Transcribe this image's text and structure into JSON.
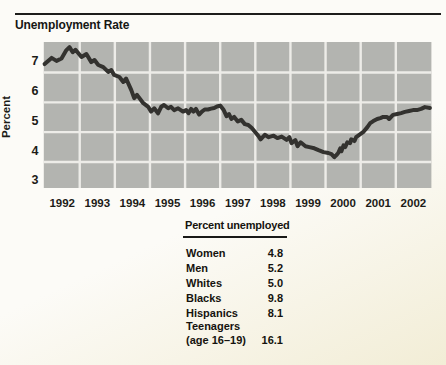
{
  "chart": {
    "title": "Unemployment Rate",
    "y_axis_label": "Percent"
  },
  "chart_data": {
    "type": "line",
    "title": "Unemployment Rate",
    "xlabel": "",
    "ylabel": "Percent",
    "x_ticks": [
      1992,
      1993,
      1994,
      1995,
      1996,
      1997,
      1998,
      1999,
      2000,
      2001,
      2002
    ],
    "y_ticks": [
      7,
      6,
      5,
      4,
      3
    ],
    "y_gridlines": [
      6.5,
      5.5,
      4.5,
      3.5
    ],
    "xlim": [
      1992,
      2003
    ],
    "ylim": [
      2.9,
      7.5
    ],
    "grid": true,
    "legend": false,
    "colors": {
      "plot_bg": "#b3b4b0",
      "gridline": "#edece8",
      "line": "#33322f",
      "text": "#1c1b17"
    },
    "series": [
      {
        "name": "Unemployment rate (percent)",
        "points": [
          [
            1992.0,
            6.78
          ],
          [
            1992.2,
            6.99
          ],
          [
            1992.34,
            6.89
          ],
          [
            1992.48,
            6.97
          ],
          [
            1992.62,
            7.25
          ],
          [
            1992.71,
            7.35
          ],
          [
            1992.8,
            7.18
          ],
          [
            1992.88,
            7.26
          ],
          [
            1993.05,
            7.02
          ],
          [
            1993.19,
            7.12
          ],
          [
            1993.33,
            6.85
          ],
          [
            1993.42,
            6.92
          ],
          [
            1993.53,
            6.75
          ],
          [
            1993.67,
            6.68
          ],
          [
            1993.81,
            6.52
          ],
          [
            1993.9,
            6.58
          ],
          [
            1993.98,
            6.42
          ],
          [
            1994.13,
            6.35
          ],
          [
            1994.24,
            6.18
          ],
          [
            1994.32,
            6.3
          ],
          [
            1994.47,
            5.91
          ],
          [
            1994.55,
            5.64
          ],
          [
            1994.63,
            5.75
          ],
          [
            1994.81,
            5.47
          ],
          [
            1994.95,
            5.35
          ],
          [
            1995.03,
            5.19
          ],
          [
            1995.12,
            5.3
          ],
          [
            1995.23,
            5.13
          ],
          [
            1995.32,
            5.35
          ],
          [
            1995.4,
            5.41
          ],
          [
            1995.52,
            5.3
          ],
          [
            1995.6,
            5.35
          ],
          [
            1995.69,
            5.24
          ],
          [
            1995.8,
            5.3
          ],
          [
            1995.94,
            5.19
          ],
          [
            1996.03,
            5.24
          ],
          [
            1996.1,
            5.14
          ],
          [
            1996.17,
            5.28
          ],
          [
            1996.24,
            5.19
          ],
          [
            1996.31,
            5.28
          ],
          [
            1996.4,
            5.09
          ],
          [
            1996.48,
            5.19
          ],
          [
            1996.56,
            5.26
          ],
          [
            1996.65,
            5.26
          ],
          [
            1996.74,
            5.29
          ],
          [
            1996.83,
            5.31
          ],
          [
            1996.91,
            5.36
          ],
          [
            1997.0,
            5.39
          ],
          [
            1997.1,
            5.24
          ],
          [
            1997.18,
            5.04
          ],
          [
            1997.25,
            5.11
          ],
          [
            1997.32,
            4.94
          ],
          [
            1997.4,
            5.01
          ],
          [
            1997.5,
            4.86
          ],
          [
            1997.6,
            4.91
          ],
          [
            1997.7,
            4.77
          ],
          [
            1997.8,
            4.74
          ],
          [
            1997.9,
            4.64
          ],
          [
            1998.0,
            4.5
          ],
          [
            1998.1,
            4.35
          ],
          [
            1998.15,
            4.26
          ],
          [
            1998.27,
            4.41
          ],
          [
            1998.38,
            4.33
          ],
          [
            1998.52,
            4.38
          ],
          [
            1998.63,
            4.3
          ],
          [
            1998.75,
            4.35
          ],
          [
            1998.89,
            4.24
          ],
          [
            1998.97,
            4.33
          ],
          [
            1999.03,
            4.13
          ],
          [
            1999.14,
            4.23
          ],
          [
            1999.2,
            4.03
          ],
          [
            1999.29,
            4.16
          ],
          [
            1999.43,
            4.03
          ],
          [
            1999.54,
            4.0
          ],
          [
            1999.68,
            3.96
          ],
          [
            1999.8,
            3.9
          ],
          [
            1999.94,
            3.83
          ],
          [
            2000.08,
            3.8
          ],
          [
            2000.17,
            3.76
          ],
          [
            2000.25,
            3.66
          ],
          [
            2000.31,
            3.73
          ],
          [
            2000.36,
            3.8
          ],
          [
            2000.42,
            3.96
          ],
          [
            2000.45,
            3.86
          ],
          [
            2000.51,
            4.06
          ],
          [
            2000.56,
            4.0
          ],
          [
            2000.62,
            4.16
          ],
          [
            2000.7,
            4.13
          ],
          [
            2000.73,
            4.26
          ],
          [
            2000.82,
            4.2
          ],
          [
            2000.87,
            4.33
          ],
          [
            2000.99,
            4.43
          ],
          [
            2001.07,
            4.5
          ],
          [
            2001.19,
            4.67
          ],
          [
            2001.27,
            4.8
          ],
          [
            2001.36,
            4.87
          ],
          [
            2001.47,
            4.94
          ],
          [
            2001.56,
            4.97
          ],
          [
            2001.64,
            5.01
          ],
          [
            2001.75,
            5.01
          ],
          [
            2001.81,
            4.94
          ],
          [
            2001.92,
            5.08
          ],
          [
            2002.04,
            5.11
          ],
          [
            2002.15,
            5.14
          ],
          [
            2002.26,
            5.18
          ],
          [
            2002.38,
            5.21
          ],
          [
            2002.49,
            5.24
          ],
          [
            2002.6,
            5.24
          ],
          [
            2002.72,
            5.28
          ],
          [
            2002.83,
            5.34
          ],
          [
            2002.97,
            5.31
          ]
        ]
      }
    ]
  },
  "table": {
    "header": "Percent unemployed",
    "rows": [
      {
        "label": "Women",
        "value": "4.8"
      },
      {
        "label": "Men",
        "value": "5.2"
      },
      {
        "label": "Whites",
        "value": "5.0"
      },
      {
        "label": "Blacks",
        "value": "9.8"
      },
      {
        "label": "Hispanics",
        "value": "8.1"
      },
      {
        "label": "Teenagers\n(age 16–19)",
        "value": "16.1"
      }
    ]
  }
}
